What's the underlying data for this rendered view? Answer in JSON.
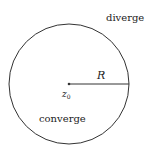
{
  "diagram": {
    "labels": {
      "outside": "diverge",
      "inside": "converge",
      "radius": "R",
      "center_base": "z",
      "center_sub": "0"
    },
    "colors": {
      "stroke": "#333333",
      "text": "#222222"
    }
  }
}
